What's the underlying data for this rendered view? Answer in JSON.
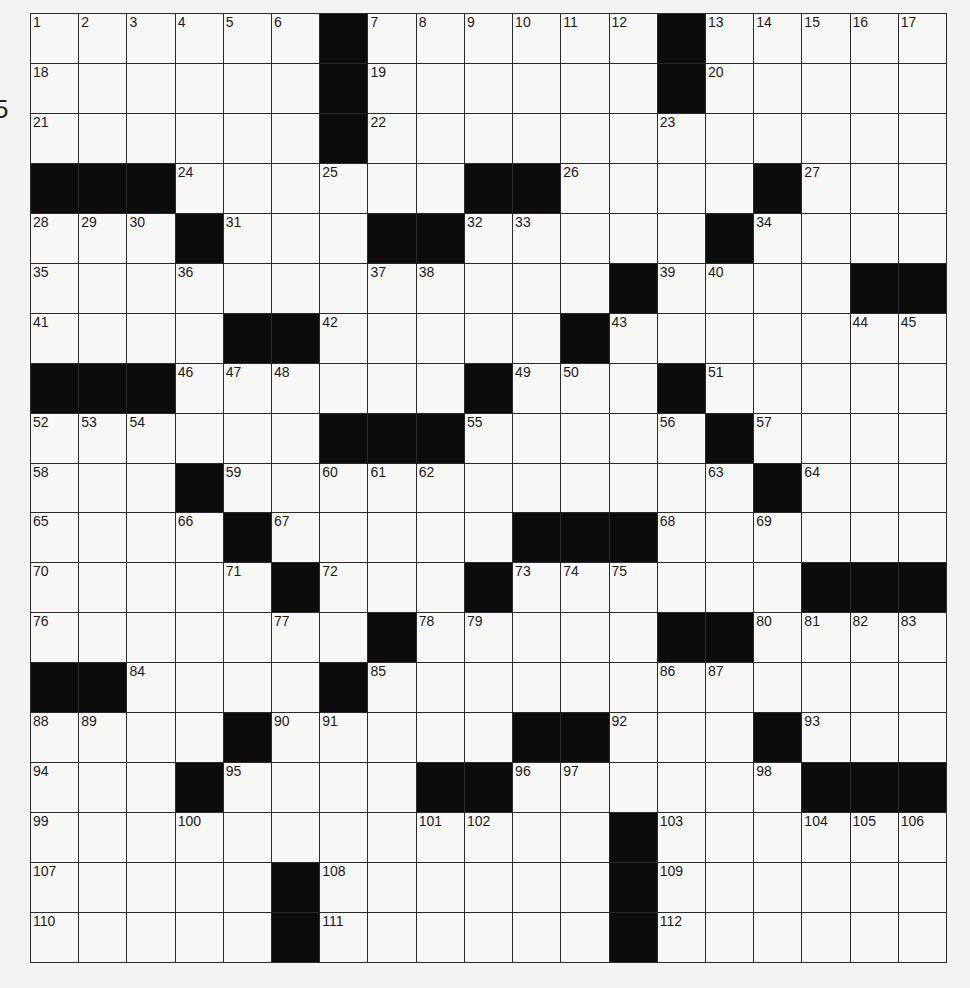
{
  "page": {
    "stray_mark": "5"
  },
  "puzzle": {
    "rows": 19,
    "cols": 19,
    "colors": {
      "background": "#f3f3f1",
      "cell": "#f7f7f5",
      "block": "#0c0c0c",
      "line": "#2a2a2a"
    },
    "grid": [
      [
        "1",
        "2",
        "3",
        "4",
        "5",
        "6",
        "#",
        "7",
        "8",
        "9",
        "10",
        "11",
        "12",
        "#",
        "13",
        "14",
        "15",
        "16",
        "17"
      ],
      [
        "18",
        ".",
        ".",
        ".",
        ".",
        ".",
        "#",
        "19",
        ".",
        ".",
        ".",
        ".",
        ".",
        "#",
        "20",
        ".",
        ".",
        ".",
        "."
      ],
      [
        "21",
        ".",
        ".",
        ".",
        ".",
        ".",
        "#",
        "22",
        ".",
        ".",
        ".",
        ".",
        ".",
        "23",
        ".",
        ".",
        ".",
        ".",
        "."
      ],
      [
        "#",
        "#",
        "#",
        "24",
        ".",
        ".",
        "25",
        ".",
        ".",
        "#",
        "#",
        "26",
        ".",
        ".",
        ".",
        "#",
        "27",
        ".",
        "."
      ],
      [
        "28",
        "29",
        "30",
        "#",
        "31",
        ".",
        ".",
        "#",
        "#",
        "32",
        "33",
        ".",
        ".",
        ".",
        "#",
        "34",
        ".",
        ".",
        "."
      ],
      [
        "35",
        ".",
        ".",
        "36",
        ".",
        ".",
        ".",
        "37",
        "38",
        ".",
        ".",
        ".",
        "#",
        "39",
        "40",
        ".",
        ".",
        "#",
        "#"
      ],
      [
        "41",
        ".",
        ".",
        ".",
        "#",
        "#",
        "42",
        ".",
        ".",
        ".",
        ".",
        "#",
        "43",
        ".",
        ".",
        ".",
        ".",
        "44",
        "45"
      ],
      [
        "#",
        "#",
        "#",
        "46",
        "47",
        "48",
        ".",
        ".",
        ".",
        "#",
        "49",
        "50",
        ".",
        "#",
        "51",
        ".",
        ".",
        ".",
        "."
      ],
      [
        "52",
        "53",
        "54",
        ".",
        ".",
        ".",
        "#",
        "#",
        "#",
        "55",
        ".",
        ".",
        ".",
        "56",
        "#",
        "57",
        ".",
        ".",
        "."
      ],
      [
        "58",
        ".",
        ".",
        "#",
        "59",
        ".",
        "60",
        "61",
        "62",
        ".",
        ".",
        ".",
        ".",
        ".",
        "63",
        "#",
        "64",
        ".",
        "."
      ],
      [
        "65",
        ".",
        ".",
        "66",
        "#",
        "67",
        ".",
        ".",
        ".",
        ".",
        "#",
        "#",
        "#",
        "68",
        ".",
        "69",
        ".",
        ".",
        "."
      ],
      [
        "70",
        ".",
        ".",
        ".",
        "71",
        "#",
        "72",
        ".",
        ".",
        "#",
        "73",
        "74",
        "75",
        ".",
        ".",
        ".",
        "#",
        "#",
        "#"
      ],
      [
        "76",
        ".",
        ".",
        ".",
        ".",
        "77",
        ".",
        "#",
        "78",
        "79",
        ".",
        ".",
        ".",
        "#",
        "#",
        "80",
        "81",
        "82",
        "83"
      ],
      [
        "#",
        "#",
        "84",
        ".",
        ".",
        ".",
        "#",
        "85",
        ".",
        ".",
        ".",
        ".",
        ".",
        "86",
        "87",
        ".",
        ".",
        ".",
        "."
      ],
      [
        "88",
        "89",
        ".",
        ".",
        "#",
        "90",
        "91",
        ".",
        ".",
        ".",
        "#",
        "#",
        "92",
        ".",
        ".",
        "#",
        "93",
        ".",
        "."
      ],
      [
        "94",
        ".",
        ".",
        "#",
        "95",
        ".",
        ".",
        ".",
        "#",
        "#",
        "96",
        "97",
        ".",
        ".",
        ".",
        "98",
        "#",
        "#",
        "#"
      ],
      [
        "99",
        ".",
        ".",
        "100",
        ".",
        ".",
        ".",
        ".",
        "101",
        "102",
        ".",
        ".",
        "#",
        "103",
        ".",
        ".",
        "104",
        "105",
        "106"
      ],
      [
        "107",
        ".",
        ".",
        ".",
        ".",
        "#",
        "108",
        ".",
        ".",
        ".",
        ".",
        ".",
        "#",
        "109",
        ".",
        ".",
        ".",
        ".",
        "."
      ],
      [
        "110",
        ".",
        ".",
        ".",
        ".",
        "#",
        "111",
        ".",
        ".",
        ".",
        ".",
        ".",
        "#",
        "112",
        ".",
        ".",
        ".",
        ".",
        "."
      ]
    ]
  }
}
